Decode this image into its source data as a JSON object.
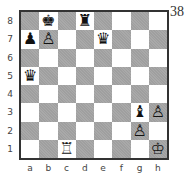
{
  "diagram_number": "38",
  "files": [
    "a",
    "b",
    "c",
    "d",
    "e",
    "f",
    "g",
    "h"
  ],
  "ranks": [
    "8",
    "7",
    "6",
    "5",
    "4",
    "3",
    "2",
    "1"
  ],
  "colors": {
    "light": "#ffffff",
    "dark": "#a9a9a9",
    "border": "#333333"
  },
  "pieces": [
    {
      "square": "b8",
      "color": "black",
      "type": "king",
      "glyph": "♚"
    },
    {
      "square": "d8",
      "color": "black",
      "type": "rook",
      "glyph": "♜"
    },
    {
      "square": "a7",
      "color": "black",
      "type": "pawn",
      "glyph": "♟"
    },
    {
      "square": "b7",
      "color": "white",
      "type": "pawn",
      "glyph": "♙"
    },
    {
      "square": "e7",
      "color": "black",
      "type": "queen",
      "glyph": "♛"
    },
    {
      "square": "a5",
      "color": "black",
      "type": "queen",
      "glyph": "♛"
    },
    {
      "square": "g3",
      "color": "black",
      "type": "bishop",
      "glyph": "♝"
    },
    {
      "square": "h3",
      "color": "white",
      "type": "pawn",
      "glyph": "♙"
    },
    {
      "square": "g2",
      "color": "white",
      "type": "pawn",
      "glyph": "♙"
    },
    {
      "square": "c1",
      "color": "white",
      "type": "rook",
      "glyph": "♖"
    },
    {
      "square": "h1",
      "color": "white",
      "type": "king",
      "glyph": "♔"
    }
  ]
}
